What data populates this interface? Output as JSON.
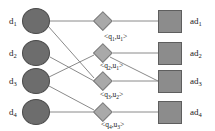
{
  "diagram": {
    "colors": {
      "document_fill": "#6d6d6d",
      "document_stroke": "#4a4a4a",
      "query_fill": "#a9a9a9",
      "query_stroke": "#7d7d7d",
      "ad_fill": "#8c8c8c",
      "ad_stroke": "#5e5e5e",
      "edge": "#8a8a8a",
      "text": "#1a1a1a",
      "background": "#ffffff"
    },
    "documents": [
      {
        "id": "d1",
        "label_base": "d",
        "label_sub": "1",
        "cx": 36,
        "cy": 21,
        "rx": 14,
        "ry": 13
      },
      {
        "id": "d2",
        "label_base": "d",
        "label_sub": "2",
        "cx": 36,
        "cy": 53,
        "rx": 14,
        "ry": 13
      },
      {
        "id": "d3",
        "label_base": "d",
        "label_sub": "3",
        "cx": 36,
        "cy": 81,
        "rx": 14,
        "ry": 13
      },
      {
        "id": "d4",
        "label_base": "d",
        "label_sub": "4",
        "cx": 36,
        "cy": 112,
        "rx": 14,
        "ry": 13
      }
    ],
    "queries": [
      {
        "id": "q1u1",
        "label": "<q1,u1>",
        "cx": 103,
        "cy": 21,
        "size": 19
      },
      {
        "id": "q2u1",
        "label": "<q2,u1>",
        "cx": 103,
        "cy": 53,
        "size": 19
      },
      {
        "id": "q3u2",
        "label": "<q3,u2>",
        "cx": 103,
        "cy": 81,
        "size": 19
      },
      {
        "id": "q4u3",
        "label": "<q4,u3>",
        "cx": 103,
        "cy": 112,
        "size": 19
      }
    ],
    "ads": [
      {
        "id": "ad1",
        "label_base": "ad",
        "label_sub": "1",
        "cx": 170,
        "cy": 21,
        "w": 24,
        "h": 23
      },
      {
        "id": "ad2",
        "label_base": "ad",
        "label_sub": "2",
        "cx": 170,
        "cy": 53,
        "w": 24,
        "h": 23
      },
      {
        "id": "ad3",
        "label_base": "ad",
        "label_sub": "3",
        "cx": 170,
        "cy": 81,
        "w": 24,
        "h": 23
      },
      {
        "id": "ad4",
        "label_base": "ad",
        "label_sub": "4",
        "cx": 170,
        "cy": 112,
        "w": 24,
        "h": 23
      }
    ],
    "document_labels": [
      {
        "text_base": "d",
        "text_sub": "1",
        "x": 9,
        "y": 17
      },
      {
        "text_base": "d",
        "text_sub": "2",
        "x": 9,
        "y": 49
      },
      {
        "text_base": "d",
        "text_sub": "3",
        "x": 9,
        "y": 77
      },
      {
        "text_base": "d",
        "text_sub": "4",
        "x": 9,
        "y": 108
      }
    ],
    "ad_labels": [
      {
        "text_base": "ad",
        "text_sub": "1",
        "x": 190,
        "y": 17
      },
      {
        "text_base": "ad",
        "text_sub": "2",
        "x": 190,
        "y": 49
      },
      {
        "text_base": "ad",
        "text_sub": "3",
        "x": 190,
        "y": 77
      },
      {
        "text_base": "ad",
        "text_sub": "4",
        "x": 190,
        "y": 108
      }
    ],
    "edge_labels": [
      {
        "id": "label-q1u1",
        "prefix": "<q",
        "sub1": "1",
        "mid": ",u",
        "sub2": "1",
        "suffix": ">",
        "x": 104,
        "y": 33
      },
      {
        "id": "label-q2u1",
        "prefix": "<q",
        "sub1": "2",
        "mid": ",u",
        "sub2": "1",
        "suffix": ">",
        "x": 100,
        "y": 62
      },
      {
        "id": "label-q3u2",
        "prefix": "<q",
        "sub1": "3",
        "mid": ",u",
        "sub2": "2",
        "suffix": ">",
        "x": 100,
        "y": 91
      },
      {
        "id": "label-q4u3",
        "prefix": "<q",
        "sub1": "4",
        "mid": ",u",
        "sub2": "3",
        "suffix": ">",
        "x": 101,
        "y": 121
      }
    ],
    "edges": [
      {
        "id": "edge-d1-q1u1",
        "from": "d1",
        "to": "q1u1",
        "x1": 50,
        "y1": 21,
        "x2": 93,
        "y2": 21
      },
      {
        "id": "edge-d1-q3u2",
        "from": "d1",
        "to": "q3u2",
        "x1": 48,
        "y1": 26,
        "x2": 94,
        "y2": 78
      },
      {
        "id": "edge-d2-q3u2",
        "from": "d2",
        "to": "q3u2",
        "x1": 50,
        "y1": 57,
        "x2": 94,
        "y2": 81
      },
      {
        "id": "edge-d3-q2u1",
        "from": "d3",
        "to": "q2u1",
        "x1": 49,
        "y1": 77,
        "x2": 94,
        "y2": 55
      },
      {
        "id": "edge-d3-q4u3",
        "from": "d3",
        "to": "q4u3",
        "x1": 49,
        "y1": 86,
        "x2": 94,
        "y2": 110
      },
      {
        "id": "edge-d4-q4u3",
        "from": "d4",
        "to": "q4u3",
        "x1": 50,
        "y1": 112,
        "x2": 93,
        "y2": 112
      },
      {
        "id": "edge-q1u1-ad1",
        "from": "q1u1",
        "to": "ad1",
        "x1": 113,
        "y1": 21,
        "x2": 158,
        "y2": 21
      },
      {
        "id": "edge-q2u1-ad2",
        "from": "q2u1",
        "to": "ad2",
        "x1": 113,
        "y1": 53,
        "x2": 158,
        "y2": 53
      },
      {
        "id": "edge-q2u1-ad3",
        "from": "q2u1",
        "to": "ad3",
        "x1": 110,
        "y1": 57,
        "x2": 158,
        "y2": 81
      },
      {
        "id": "edge-q3u2-ad3",
        "from": "q3u2",
        "to": "ad3",
        "x1": 113,
        "y1": 81,
        "x2": 158,
        "y2": 81
      },
      {
        "id": "edge-q4u3-ad4",
        "from": "q4u3",
        "to": "ad4",
        "x1": 113,
        "y1": 112,
        "x2": 158,
        "y2": 112
      }
    ]
  }
}
